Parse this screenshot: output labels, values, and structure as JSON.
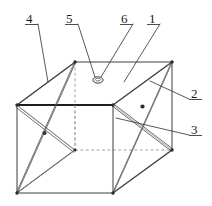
{
  "figure": {
    "type": "isometric-line-drawing",
    "stroke_color": "#3a3a3a",
    "heavy_stroke_color": "#222222",
    "hidden_line_color": "#8a8a8a",
    "background": "#ffffff"
  },
  "callouts": [
    {
      "id": "4",
      "label": "4",
      "x": 26,
      "y": 14,
      "underline_width": 13,
      "target_x": 48,
      "target_y": 82
    },
    {
      "id": "5",
      "label": "5",
      "x": 66,
      "y": 14,
      "underline_width": 13,
      "target_x": 97,
      "target_y": 78
    },
    {
      "id": "6",
      "label": "6",
      "x": 121,
      "y": 14,
      "underline_width": 13,
      "target_x": 100,
      "target_y": 78
    },
    {
      "id": "1",
      "label": "1",
      "x": 148,
      "y": 14,
      "underline_width": 13,
      "target_x": 122,
      "target_y": 80
    },
    {
      "id": "2",
      "label": "2",
      "x": 190,
      "y": 94,
      "underline_width": 13,
      "target_x": 152,
      "target_y": 80
    },
    {
      "id": "3",
      "label": "3",
      "x": 190,
      "y": 130,
      "underline_width": 13,
      "target_x": 115,
      "target_y": 118
    }
  ],
  "geometry": {
    "top_front_left": [
      17,
      105
    ],
    "top_front_right": [
      113,
      105
    ],
    "top_back_left": [
      75,
      62
    ],
    "top_back_right": [
      172,
      62
    ],
    "bottom_front_left": [
      17,
      193
    ],
    "bottom_front_right": [
      113,
      193
    ],
    "bottom_back_left": [
      75,
      150
    ],
    "bottom_back_right": [
      172,
      150
    ],
    "ring_center": [
      98,
      80
    ],
    "ring_rx": 5,
    "ring_ry": 3,
    "left_brace_node": [
      44,
      133
    ],
    "right_brace_node": [
      142,
      106
    ]
  },
  "notes": {
    "hidden_edges": "back-left vertical and back-bottom edges shown dashed",
    "braces": "X cross-bracing on left and right faces; single diagonal on top face"
  }
}
